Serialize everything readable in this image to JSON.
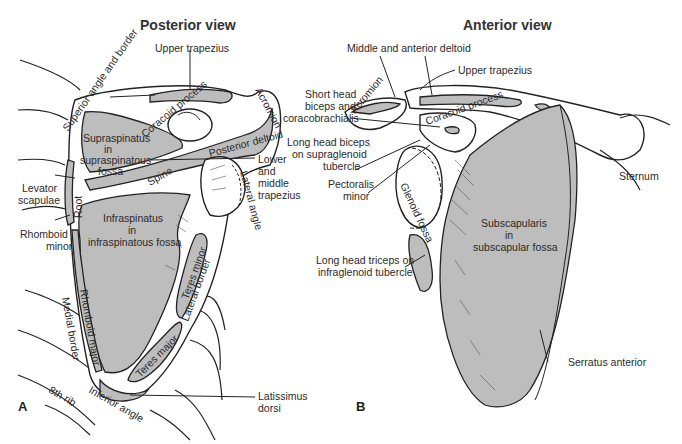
{
  "colors": {
    "muscle_fill": "#bdbdbd",
    "outline": "#222222",
    "background": "#ffffff",
    "text": "#2a2a2a"
  },
  "panels": {
    "posterior": {
      "letter": "A",
      "title": "Posterior view",
      "labels": {
        "upper_trapezius": "Upper trapezius",
        "acromion": "Acromion",
        "superior_angle": "Superior angle and border",
        "coracoid_process": "Coracoid process",
        "supraspinatus_1": "Supraspinatus",
        "supraspinatus_2": "in",
        "supraspinatus_3": "supraspinatous",
        "supraspinatus_4": "fossa",
        "posterior_deltoid": "Posterior deltoid",
        "lower_trap_1": "Lower",
        "lower_trap_2": "and",
        "lower_trap_3": "middle",
        "lower_trap_4": "trapezius",
        "spine": "Spine",
        "lateral_angle": "Lateral angle",
        "levator_1": "Levator",
        "levator_2": "scapulae",
        "root": "Root",
        "rhomboid_minor_1": "Rhomboid",
        "rhomboid_minor_2": "minor",
        "infraspinatus_1": "Infraspinatus",
        "infraspinatus_2": "in",
        "infraspinatus_3": "infraspinatous fossa",
        "teres_minor": "Teres minor",
        "lateral_border": "Lateral border",
        "medial_border": "Medial border",
        "rhomboid_major": "Rhomboid major",
        "teres_major": "Teres major",
        "latissimus_1": "Latissimus",
        "latissimus_2": "dorsi",
        "eighth_rib": "8th rib",
        "inferior_angle": "Inferior angle"
      }
    },
    "anterior": {
      "letter": "B",
      "title": "Anterior view",
      "labels": {
        "middle_anterior_deltoid": "Middle and anterior deltoid",
        "upper_trapezius": "Upper trapezius",
        "short_head_1": "Short head",
        "short_head_2": "biceps and",
        "short_head_3": "coracobrachialis",
        "acromion": "Acromion",
        "coracoid_process": "Coracoid process",
        "long_head_biceps_1": "Long head biceps",
        "long_head_biceps_2": "on supraglenoid",
        "long_head_biceps_3": "tubercle",
        "pectoralis_1": "Pectoralis",
        "pectoralis_2": "minor",
        "glenoid_fossa": "Glenoid fossa",
        "sternum": "Sternum",
        "subscapularis_1": "Subscapularis",
        "subscapularis_2": "in",
        "subscapularis_3": "subscapular fossa",
        "long_head_triceps_1": "Long head triceps on",
        "long_head_triceps_2": "infraglenoid tubercle",
        "serratus_anterior": "Serratus anterior"
      }
    }
  }
}
